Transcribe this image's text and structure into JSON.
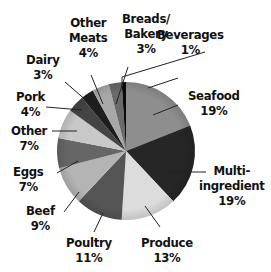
{
  "chart_data": {
    "type": "pie",
    "title": "",
    "start_angle_deg": 0,
    "direction": "clockwise",
    "slices": [
      {
        "label": "Seafood",
        "value": 19,
        "display": "19%",
        "color": "#8e8e8e"
      },
      {
        "label": "Multi-ingredient",
        "value": 19,
        "display": "19%",
        "color": "#262626"
      },
      {
        "label": "Produce",
        "value": 13,
        "display": "13%",
        "color": "#dcdcdc"
      },
      {
        "label": "Poultry",
        "value": 11,
        "display": "11%",
        "color": "#555555"
      },
      {
        "label": "Beef",
        "value": 9,
        "display": "9%",
        "color": "#b4b4b4"
      },
      {
        "label": "Eggs",
        "value": 7,
        "display": "7%",
        "color": "#666666"
      },
      {
        "label": "Other",
        "value": 7,
        "display": "7%",
        "color": "#c8c8c8"
      },
      {
        "label": "Pork",
        "value": 4,
        "display": "4%",
        "color": "#444444"
      },
      {
        "label": "Dairy",
        "value": 3,
        "display": "3%",
        "color": "#1e1e1e"
      },
      {
        "label": "Other Meats",
        "value": 4,
        "display": "4%",
        "color": "#a8a8a8"
      },
      {
        "label": "Breads/Bakery",
        "value": 3,
        "display": "3%",
        "color": "#6a6a6a"
      },
      {
        "label": "Beverages",
        "value": 1,
        "display": "1%",
        "color": "#0a0a0a"
      }
    ],
    "legend": "none (direct labels with leader lines)"
  },
  "labels": {
    "seafood": {
      "name": "Seafood",
      "pct": "19%"
    },
    "multi": {
      "name1": "Multi-",
      "name2": "ingredient",
      "pct": "19%"
    },
    "produce": {
      "name": "Produce",
      "pct": "13%"
    },
    "poultry": {
      "name": "Poultry",
      "pct": "11%"
    },
    "beef": {
      "name": "Beef",
      "pct": "9%"
    },
    "eggs": {
      "name": "Eggs",
      "pct": "7%"
    },
    "other": {
      "name": "Other",
      "pct": "7%"
    },
    "pork": {
      "name": "Pork",
      "pct": "4%"
    },
    "dairy": {
      "name": "Dairy",
      "pct": "3%"
    },
    "other_meats": {
      "name1": "Other",
      "name2": "Meats",
      "pct": "4%"
    },
    "breads": {
      "name1": "Breads/",
      "name2": "Bakery",
      "pct": "3%"
    },
    "beverages": {
      "name": "Beverages",
      "pct": "1%"
    }
  }
}
